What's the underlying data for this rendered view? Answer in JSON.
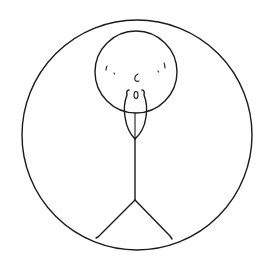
{
  "drawing": {
    "description": "Hand-drawn stick figure with a long beard inside a circle",
    "colors": {
      "background": "#ffffff",
      "ink": "#1a1a1a"
    },
    "outer_circle": {
      "cx": 137,
      "cy": 135,
      "r": 115
    },
    "head": {
      "cx": 136,
      "cy": 72,
      "r": 41
    },
    "body": {
      "x": 135,
      "y1": 138,
      "y2": 200
    },
    "legs": {
      "hip": [
        135,
        200
      ],
      "left_foot": [
        97,
        238
      ],
      "right_foot": [
        172,
        239
      ]
    }
  }
}
